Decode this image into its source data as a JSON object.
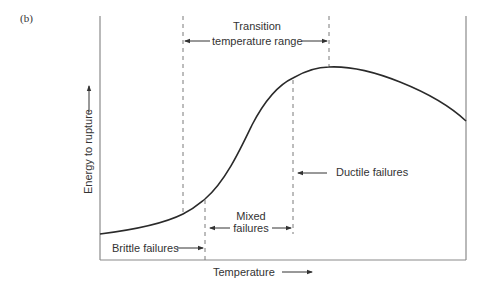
{
  "figure": {
    "panel_label": "(b)",
    "x_axis_label": "Temperature",
    "y_axis_label": "Energy to rupture",
    "annotations": {
      "transition_line1": "Transition",
      "transition_line2": "temperature range",
      "mixed_line1": "Mixed",
      "mixed_line2": "failures",
      "brittle": "Brittle failures",
      "ductile": "Ductile failures"
    },
    "colors": {
      "axis": "#8a8a8a",
      "curve": "#2a2a2a",
      "dashed": "#7a7a7a",
      "text": "#333333"
    }
  }
}
